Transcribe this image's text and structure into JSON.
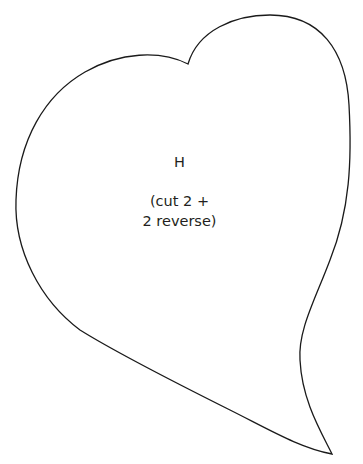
{
  "pattern_piece": {
    "letter": "H",
    "instruction_line1": "(cut 2 +",
    "instruction_line2": "2 reverse)",
    "outline_color": "#1a1a1a",
    "shape": "heart-leaf"
  }
}
